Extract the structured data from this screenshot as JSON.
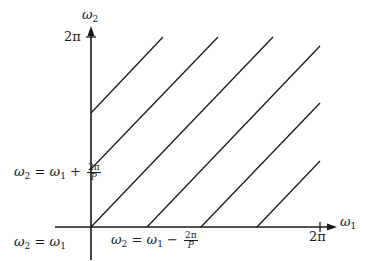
{
  "diagram": {
    "axes": {
      "x_label_symbol": "ω",
      "x_label_sub": "1",
      "y_label_symbol": "ω",
      "y_label_sub": "2",
      "x_tick_label": "2π",
      "y_tick_label": "2π"
    },
    "annotations": {
      "diag_main": {
        "lhs": "ω",
        "lhs_sub": "2",
        "eq": " = ",
        "rhs": "ω",
        "rhs_sub": "1"
      },
      "diag_plus": {
        "lhs": "ω",
        "lhs_sub": "2",
        "eq": " = ",
        "rhs": "ω",
        "rhs_sub": "1",
        "op": " + ",
        "num": "2π",
        "den": "P"
      },
      "diag_minus": {
        "lhs": "ω",
        "lhs_sub": "2",
        "eq": " = ",
        "rhs": "ω",
        "rhs_sub": "1",
        "op": " − ",
        "num": "2π",
        "den": "P"
      }
    },
    "colors": {
      "line": "#1a1a1a",
      "background": "#ffffff"
    }
  }
}
